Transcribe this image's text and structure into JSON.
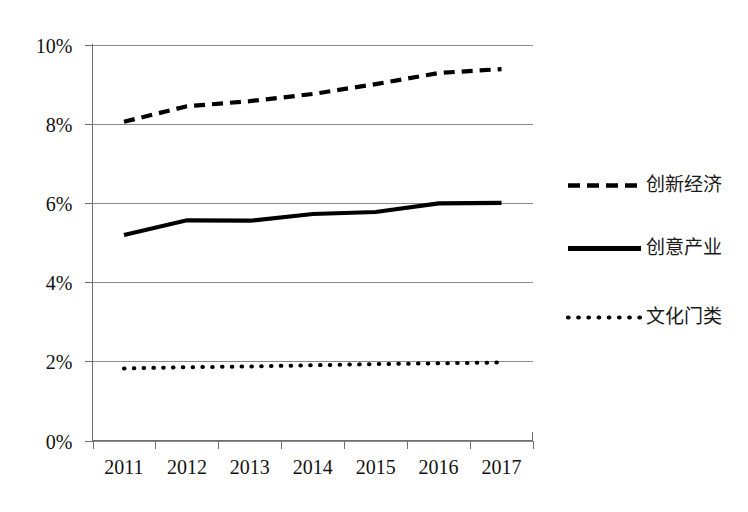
{
  "chart_data": {
    "type": "line",
    "title": "",
    "subtitle": "",
    "xlabel": "",
    "ylabel": "",
    "categories": [
      "2011",
      "2012",
      "2013",
      "2014",
      "2015",
      "2016",
      "2017"
    ],
    "x_tick_labels": [
      "2011",
      "2012",
      "2013",
      "2014",
      "2015",
      "2016",
      "2017"
    ],
    "y_tick_labels": [
      "0%",
      "2%",
      "4%",
      "6%",
      "8%",
      "10%"
    ],
    "y_tick_values": [
      0,
      2,
      4,
      6,
      8,
      10
    ],
    "ylim": [
      0,
      10
    ],
    "y_unit": "%",
    "grid": true,
    "grid_axis": "y",
    "legend_position": "right",
    "series": [
      {
        "name": "创新经济",
        "style": "dashed",
        "color": "#000000",
        "values": [
          8.05,
          8.44,
          8.57,
          8.75,
          9.0,
          9.28,
          9.38
        ]
      },
      {
        "name": "创意产业",
        "style": "solid",
        "color": "#000000",
        "values": [
          5.19,
          5.56,
          5.55,
          5.72,
          5.77,
          5.99,
          6.0
        ]
      },
      {
        "name": "文化门类",
        "style": "dotted",
        "color": "#000000",
        "values": [
          1.82,
          1.85,
          1.87,
          1.9,
          1.93,
          1.95,
          1.97
        ]
      }
    ]
  },
  "legend": {
    "items": [
      {
        "label": "创新经济",
        "style": "dashed"
      },
      {
        "label": "创意产业",
        "style": "solid"
      },
      {
        "label": "文化门类",
        "style": "dotted"
      }
    ]
  },
  "axes": {
    "y_labels": [
      "10%",
      "8%",
      "6%",
      "4%",
      "2%",
      "0%"
    ],
    "x_labels": [
      "2011",
      "2012",
      "2013",
      "2014",
      "2015",
      "2016",
      "2017"
    ]
  }
}
